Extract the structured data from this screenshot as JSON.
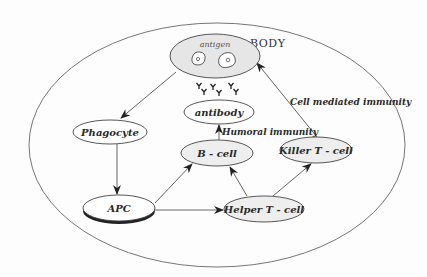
{
  "diagram": {
    "container": {
      "label": "BODY",
      "cx": 217,
      "cy": 145,
      "rx": 188,
      "ry": 122
    },
    "nodes": [
      {
        "id": "antigen",
        "label": "antigen",
        "cx": 215,
        "cy": 56,
        "rx": 45,
        "ry": 22,
        "fill": "#e6e6e6"
      },
      {
        "id": "antibody",
        "label": "antibody",
        "cx": 219,
        "cy": 112,
        "rx": 35,
        "ry": 12,
        "fill": "#ffffff"
      },
      {
        "id": "phagocyte",
        "label": "Phagocyte",
        "cx": 110,
        "cy": 132,
        "rx": 37,
        "ry": 12,
        "fill": "#ffffff"
      },
      {
        "id": "b_cell",
        "label": "B - cell",
        "cx": 217,
        "cy": 153,
        "rx": 36,
        "ry": 13,
        "fill": "#eeeeee"
      },
      {
        "id": "killer_t",
        "label": "Killer T - cell",
        "cx": 316,
        "cy": 150,
        "rx": 36,
        "ry": 13,
        "fill": "#eeeeee"
      },
      {
        "id": "apc",
        "label": "APC",
        "cx": 119,
        "cy": 208,
        "rx": 36,
        "ry": 13,
        "fill": "#ffffff"
      },
      {
        "id": "helper_t",
        "label": "Helper T - cell",
        "cx": 264,
        "cy": 209,
        "rx": 40,
        "ry": 13,
        "fill": "#eeeeee"
      }
    ],
    "edges": [
      {
        "from": "antigen",
        "to": "phagocyte",
        "x1": 176,
        "y1": 72,
        "x2": 121,
        "y2": 118
      },
      {
        "from": "phagocyte",
        "to": "apc",
        "x1": 117,
        "y1": 144,
        "x2": 117,
        "y2": 194
      },
      {
        "from": "apc",
        "to": "b_cell",
        "x1": 155,
        "y1": 203,
        "x2": 192,
        "y2": 164
      },
      {
        "from": "apc",
        "to": "helper_t",
        "x1": 155,
        "y1": 210,
        "x2": 223,
        "y2": 210
      },
      {
        "from": "helper_t",
        "to": "b_cell",
        "x1": 247,
        "y1": 196,
        "x2": 230,
        "y2": 167
      },
      {
        "from": "helper_t",
        "to": "killer_t",
        "x1": 273,
        "y1": 196,
        "x2": 311,
        "y2": 164
      },
      {
        "from": "b_cell",
        "to": "antibody",
        "x1": 219,
        "y1": 140,
        "x2": 219,
        "y2": 125
      },
      {
        "from": "killer_t",
        "to": "antigen",
        "x1": 317,
        "y1": 137,
        "x2": 257,
        "y2": 63
      }
    ],
    "edge_labels": [
      {
        "id": "humoral",
        "text": "Humoral immunity",
        "x": 222,
        "y": 135
      },
      {
        "id": "cell_mediated",
        "text": "Cell mediated immunity",
        "x": 290,
        "y": 105
      }
    ],
    "antibody_glyphs": [
      {
        "x": 199,
        "y": 86
      },
      {
        "x": 213,
        "y": 87
      },
      {
        "x": 231,
        "y": 86
      },
      {
        "x": 204,
        "y": 92
      },
      {
        "x": 219,
        "y": 93
      },
      {
        "x": 236,
        "y": 92
      }
    ]
  }
}
